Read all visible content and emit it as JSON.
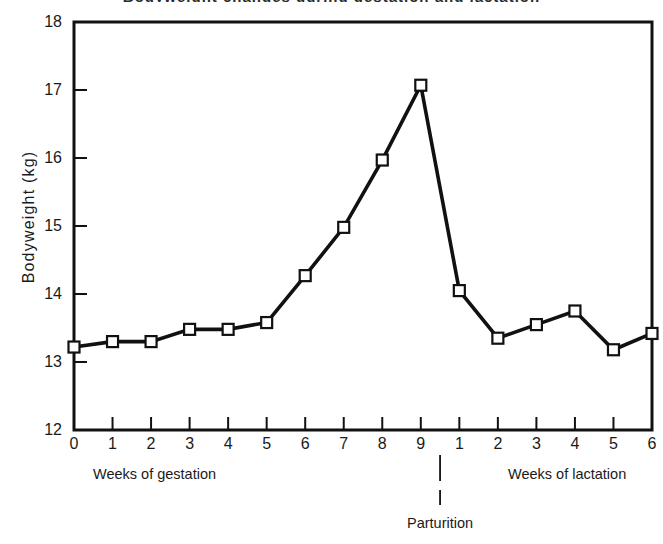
{
  "figure": {
    "title_remnant": "Bodyweight changes during gestation and lactation",
    "ylabel": "Bodyweight  (kg)",
    "caption_gestation": "Weeks of gestation",
    "caption_lactation": "Weeks of lactation",
    "caption_parturition": "Parturition",
    "line_color": "#111111",
    "marker_fill": "#111111",
    "background": "#ffffff"
  },
  "chart_data": {
    "type": "line",
    "title": "Bodyweight changes during gestation and lactation",
    "xlabel": "",
    "ylabel": "Bodyweight  (kg)",
    "ylim": [
      12,
      18
    ],
    "ytick_labels": [
      "18",
      "17",
      "16",
      "15",
      "14",
      "13",
      "12"
    ],
    "ytick_values": [
      18,
      17,
      16,
      15,
      14,
      13,
      12
    ],
    "xtick_labels": [
      "0",
      "1",
      "2",
      "3",
      "4",
      "5",
      "6",
      "7",
      "8",
      "9",
      "1",
      "2",
      "3",
      "4",
      "5",
      "6"
    ],
    "categories": [
      "gestation 0",
      "gestation 1",
      "gestation 2",
      "gestation 3",
      "gestation 4",
      "gestation 5",
      "gestation 6",
      "gestation 7",
      "gestation 8",
      "gestation 9",
      "lactation 1",
      "lactation 2",
      "lactation 3",
      "lactation 4",
      "lactation 5",
      "lactation 6"
    ],
    "values": [
      13.22,
      13.3,
      13.3,
      13.48,
      13.48,
      13.58,
      14.27,
      14.98,
      15.97,
      17.07,
      14.05,
      13.35,
      13.55,
      13.75,
      13.18,
      13.42
    ],
    "phases": [
      {
        "name": "Weeks of gestation",
        "weeks": [
          "0",
          "1",
          "2",
          "3",
          "4",
          "5",
          "6",
          "7",
          "8",
          "9"
        ]
      },
      {
        "name": "Weeks of lactation",
        "weeks": [
          "1",
          "2",
          "3",
          "4",
          "5",
          "6"
        ]
      }
    ],
    "annotations": [
      {
        "label": "Parturition",
        "x_between": [
          "gestation 9",
          "lactation 1"
        ]
      }
    ],
    "grid": false,
    "legend": false,
    "marker": "open-square",
    "series": [
      {
        "name": "Bodyweight",
        "values": [
          13.22,
          13.3,
          13.3,
          13.48,
          13.48,
          13.58,
          14.27,
          14.98,
          15.97,
          17.07,
          14.05,
          13.35,
          13.55,
          13.75,
          13.18,
          13.42
        ]
      }
    ]
  }
}
